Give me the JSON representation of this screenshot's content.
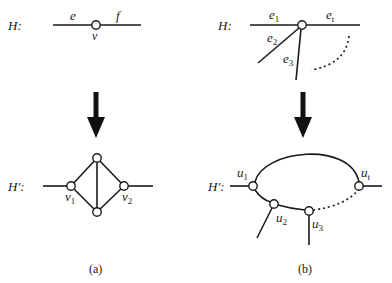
{
  "figure": {
    "panel_a": {
      "caption": "(a)",
      "top": {
        "graph_label": "H:",
        "edge_labels": [
          "e",
          "f"
        ],
        "vertex_label": "v"
      },
      "bottom": {
        "graph_label": "H′:",
        "vertex_labels": [
          {
            "base": "v",
            "sub": "1"
          },
          {
            "base": "v",
            "sub": "2"
          }
        ]
      }
    },
    "panel_b": {
      "caption": "(b)",
      "top": {
        "graph_label": "H:",
        "edge_labels": [
          {
            "base": "e",
            "sub": "1"
          },
          {
            "base": "e",
            "sub": "t"
          },
          {
            "base": "e",
            "sub": "2"
          },
          {
            "base": "e",
            "sub": "3"
          }
        ]
      },
      "bottom": {
        "graph_label": "H′:",
        "vertex_labels": [
          {
            "base": "u",
            "sub": "1"
          },
          {
            "base": "u",
            "sub": "2"
          },
          {
            "base": "u",
            "sub": "3"
          },
          {
            "base": "u",
            "sub": "t"
          }
        ]
      }
    },
    "colors": {
      "stroke": "#1a1a1a",
      "background": "#ffffff"
    }
  }
}
